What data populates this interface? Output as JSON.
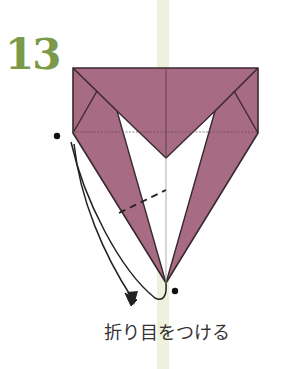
{
  "step": {
    "number": "13",
    "instruction": "折り目をつける"
  },
  "colors": {
    "step_number": "#7a9a4a",
    "paper_fill": "#a86b84",
    "band": "#eef2dc",
    "line": "#3a2a30",
    "text": "#333333"
  },
  "icons": {
    "fold_arrow": "curved-arrow-icon",
    "reference_dot_left": "dot-marker-icon",
    "reference_dot_right": "dot-marker-icon"
  }
}
